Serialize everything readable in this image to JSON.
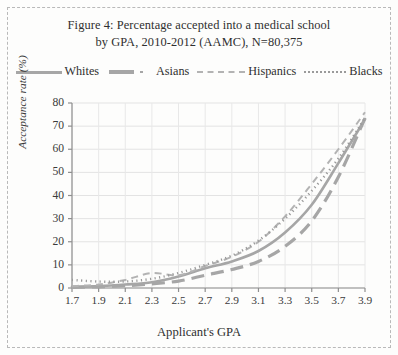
{
  "figure": {
    "title_line1": "Figure 4: Percentage accepted into a medical school",
    "title_line2": "by GPA, 2010-2012 (AAMC), N=80,375",
    "border_style": "dashed",
    "border_color": "#b9b9b9"
  },
  "legend": {
    "position": "top",
    "items": [
      {
        "label": "Whites",
        "style": "solid",
        "color": "#a6a6a6"
      },
      {
        "label": "Asians",
        "style": "long-dash",
        "color": "#a6a6a6"
      },
      {
        "label": "Hispanics",
        "style": "dashed",
        "color": "#b3b3b3"
      },
      {
        "label": "Blacks",
        "style": "dotted",
        "color": "#9a9a9a"
      }
    ]
  },
  "axes": {
    "xlabel": "Applicant's GPA",
    "ylabel": "Acceptance rate (%)",
    "xticks": [
      "1.7",
      "1.9",
      "2.1",
      "2.3",
      "2.5",
      "2.7",
      "2.9",
      "3.1",
      "3.3",
      "3.5",
      "3.7",
      "3.9"
    ],
    "yticks": [
      "0",
      "10",
      "20",
      "30",
      "40",
      "50",
      "60",
      "70",
      "80"
    ]
  },
  "chart_data": {
    "type": "line",
    "title": "Figure 4: Percentage accepted into a medical school by GPA, 2010-2012 (AAMC), N=80,375",
    "xlabel": "Applicant's GPA",
    "ylabel": "Acceptance rate (%)",
    "xlim": [
      1.7,
      3.9
    ],
    "ylim": [
      0,
      80
    ],
    "xticks": [
      1.7,
      1.9,
      2.1,
      2.3,
      2.5,
      2.7,
      2.9,
      3.1,
      3.3,
      3.5,
      3.7,
      3.9
    ],
    "yticks": [
      0,
      10,
      20,
      30,
      40,
      50,
      60,
      70,
      80
    ],
    "grid": true,
    "legend_position": "top",
    "x": [
      1.7,
      1.9,
      2.1,
      2.3,
      2.5,
      2.7,
      2.9,
      3.1,
      3.3,
      3.5,
      3.7,
      3.9
    ],
    "series": [
      {
        "name": "Whites",
        "style": "solid",
        "color": "#a6a6a6",
        "values": [
          0.5,
          0.8,
          1.5,
          2.5,
          5.0,
          8.5,
          11.5,
          16.0,
          24.0,
          36.0,
          54.0,
          73.0
        ]
      },
      {
        "name": "Asians",
        "style": "long-dash",
        "color": "#a6a6a6",
        "values": [
          0.3,
          0.5,
          1.0,
          1.8,
          3.0,
          5.5,
          8.0,
          11.5,
          18.0,
          29.0,
          48.0,
          73.5
        ]
      },
      {
        "name": "Hispanics",
        "style": "dashed",
        "color": "#b3b3b3",
        "values": [
          0.8,
          1.5,
          3.5,
          6.5,
          5.5,
          9.5,
          13.5,
          20.0,
          31.0,
          45.0,
          60.0,
          76.0
        ]
      },
      {
        "name": "Blacks",
        "style": "dotted",
        "color": "#9a9a9a",
        "values": [
          3.5,
          2.8,
          2.8,
          4.0,
          6.5,
          10.0,
          14.0,
          20.5,
          30.0,
          42.0,
          56.0,
          73.5
        ]
      }
    ]
  }
}
